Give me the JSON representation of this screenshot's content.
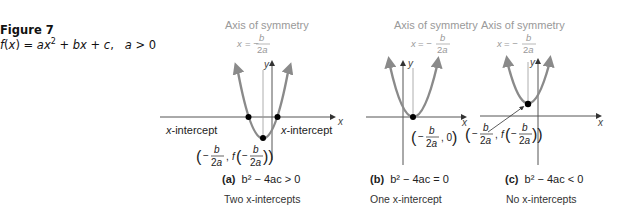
{
  "figure": {
    "title": "Figure 7",
    "equation": "f(x) = ax² + bx + c,   a > 0"
  },
  "common": {
    "axis_of_symmetry_label": "Axis of symmetry",
    "axis_of_symmetry_eq": "x = −b/2a",
    "x_axis_label": "x",
    "y_axis_label": "y"
  },
  "panels": [
    {
      "id": "a",
      "label": "(a)",
      "condition": "b² − 4ac > 0",
      "description": "Two x-intercepts",
      "left_intercept_label": "x-intercept",
      "right_intercept_label": "x-intercept",
      "vertex_label": "(−b/2a, f(−b/2a))"
    },
    {
      "id": "b",
      "label": "(b)",
      "condition": "b² − 4ac = 0",
      "description": "One x-intercept",
      "vertex_label": "(−b/2a, 0)"
    },
    {
      "id": "c",
      "label": "(c)",
      "condition": "b² − 4ac < 0",
      "description": "No x-intercepts",
      "vertex_label": "(−b/2a, f(−b/2a))"
    }
  ],
  "colors": {
    "curve": "#8a8a8a",
    "axis": "#555555",
    "point": "#000000",
    "annotation": "#888888"
  }
}
